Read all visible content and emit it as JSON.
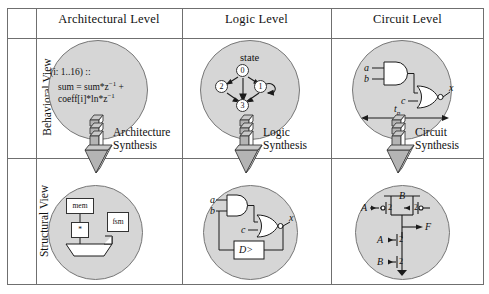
{
  "figure": {
    "type": "y-chart-design-abstraction-matrix",
    "columns": [
      {
        "id": "architectural",
        "label": "Architectural Level"
      },
      {
        "id": "logic",
        "label": "Logic Level"
      },
      {
        "id": "circuit",
        "label": "Circuit Level"
      }
    ],
    "rows": [
      {
        "id": "behavioral",
        "label": "Behavioral View"
      },
      {
        "id": "structural",
        "label": "Structural View"
      }
    ],
    "synthesis_arrows": [
      {
        "id": "architecture-synthesis",
        "label_line1": "Architecture",
        "label_line2": "Synthesis"
      },
      {
        "id": "logic-synthesis",
        "label_line1": "Logic",
        "label_line2": "Synthesis"
      },
      {
        "id": "circuit-synthesis",
        "label_line1": "Circuit",
        "label_line2": "Synthesis"
      }
    ]
  },
  "cells": {
    "architectural_behavioral": {
      "code_line1": "(i: 1..16) ::",
      "code_line2_a": "sum = sum*z",
      "code_line2_exp": "−1",
      "code_line2_b": " +",
      "code_line3_a": "coeff[i]*ln*z",
      "code_line3_exp": "−1"
    },
    "logic_behavioral": {
      "title": "state",
      "states": [
        "0",
        "1",
        "2",
        "3"
      ],
      "self_loop_on": "1"
    },
    "circuit_behavioral": {
      "input_a": "a",
      "input_b": "b",
      "input_c": "c",
      "output_x": "x",
      "delay_label": "t",
      "delay_sub": "p"
    },
    "architectural_structural": {
      "block_mem": "mem",
      "block_mult": "*",
      "block_fsm": "fsm"
    },
    "logic_structural": {
      "input_a": "a",
      "input_b": "b",
      "input_c": "c",
      "output_x": "x",
      "register": "D>"
    },
    "circuit_structural": {
      "pmos_left_input": "A",
      "pmos_right_input": "B",
      "nmos_top_input": "A",
      "nmos_bottom_input": "B",
      "output": "F",
      "width_pmos_left": "2",
      "width_pmos_right": "2",
      "width_nmos_top": "2",
      "width_nmos_bottom": "2"
    }
  },
  "colors": {
    "blob_fill": "#d6d6d6",
    "blob_stroke": "#777777",
    "frame_stroke": "#6f6f6f",
    "arrow_shade": "#a9a9a9",
    "arrow_face": "#ffffff",
    "ink": "#111111"
  }
}
